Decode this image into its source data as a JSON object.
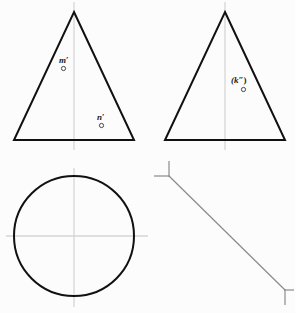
{
  "drawing": {
    "title": "Orthographic projection exercise",
    "canvas": {
      "width": 295,
      "height": 313
    },
    "background_color": "#fcfcfc",
    "line_color": "#111111",
    "centerline_color": "#d6d6d6",
    "mitre_color": "#8a8a8a"
  },
  "labels": {
    "m_prime": {
      "text": "m",
      "mark": "′"
    },
    "n_prime": {
      "text": "n",
      "mark": "′"
    },
    "k_double_prime": {
      "text": "(k",
      "mark": "″)"
    }
  },
  "views": {
    "front_view": {
      "name": "front-view-triangle",
      "apex": [
        74,
        12
      ],
      "base_left": [
        14,
        140
      ],
      "base_right": [
        134,
        140
      ],
      "points": [
        {
          "id": "m_prime",
          "marker": [
            63,
            68
          ],
          "label_at": [
            59,
            56
          ]
        },
        {
          "id": "n_prime",
          "marker": [
            101,
            125
          ],
          "label_at": [
            97,
            113
          ]
        }
      ]
    },
    "side_view": {
      "name": "side-view-triangle",
      "apex": [
        225,
        12
      ],
      "base_left": [
        165,
        140
      ],
      "base_right": [
        285,
        140
      ],
      "points": [
        {
          "id": "k_double_prime",
          "marker": [
            243,
            89
          ],
          "label_at": [
            231,
            76
          ]
        }
      ]
    },
    "top_view": {
      "name": "top-view-circle",
      "center": [
        74,
        236
      ],
      "radius": 60,
      "horizontal_centerline": [
        6,
        236,
        148,
        236
      ],
      "vertical_centerline": [
        74,
        168,
        74,
        307
      ]
    },
    "mitre_line": {
      "name": "forty-five-degree-mitre-line",
      "start": [
        169,
        176
      ],
      "end": [
        285,
        290
      ],
      "corner_mark_start": {
        "vertical": [
          169,
          161,
          169,
          176
        ],
        "horizontal": [
          154,
          176,
          169,
          176
        ]
      },
      "corner_mark_end": {
        "vertical": [
          285,
          290,
          285,
          305
        ],
        "horizontal": [
          285,
          290,
          294,
          290
        ]
      }
    }
  }
}
